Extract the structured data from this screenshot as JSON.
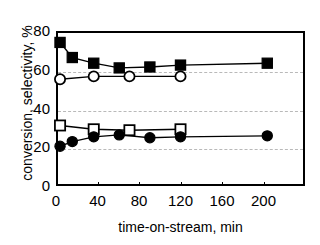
{
  "chart_data": {
    "type": "line",
    "title": "",
    "xlabel": "time-on-stream, min",
    "ylabel": "conversion, selectivity, %",
    "xlim": [
      0,
      240
    ],
    "ylim": [
      0,
      80
    ],
    "xticks": [
      0,
      40,
      80,
      120,
      160,
      200
    ],
    "yticks": [
      0,
      20,
      40,
      60,
      80
    ],
    "xtick_labels": [
      "0",
      "40",
      "80",
      "120",
      "160",
      "200"
    ],
    "ytick_labels": [
      "0",
      "20",
      "40",
      "60",
      "80"
    ],
    "grid": "horizontal-dashed",
    "gridlines": [
      20,
      40,
      60
    ],
    "legend": "none",
    "series": [
      {
        "name": "filled-square",
        "marker": "filled-square",
        "color": "#000000",
        "x": [
          2,
          14,
          35,
          60,
          90,
          120,
          205
        ],
        "y": [
          75,
          67,
          64,
          61.5,
          62,
          63,
          64
        ]
      },
      {
        "name": "open-circle",
        "marker": "open-circle",
        "color": "#000000",
        "x": [
          2,
          35,
          70,
          120
        ],
        "y": [
          55.5,
          57,
          57,
          57
        ]
      },
      {
        "name": "open-square",
        "marker": "open-square",
        "color": "#000000",
        "x": [
          2,
          35,
          70,
          120
        ],
        "y": [
          31,
          29,
          28.5,
          29
        ]
      },
      {
        "name": "filled-circle",
        "marker": "filled-circle",
        "color": "#000000",
        "x": [
          2,
          14,
          35,
          60,
          90,
          120,
          205
        ],
        "y": [
          20,
          22.5,
          25,
          26,
          24.5,
          25,
          25.5
        ]
      }
    ]
  }
}
